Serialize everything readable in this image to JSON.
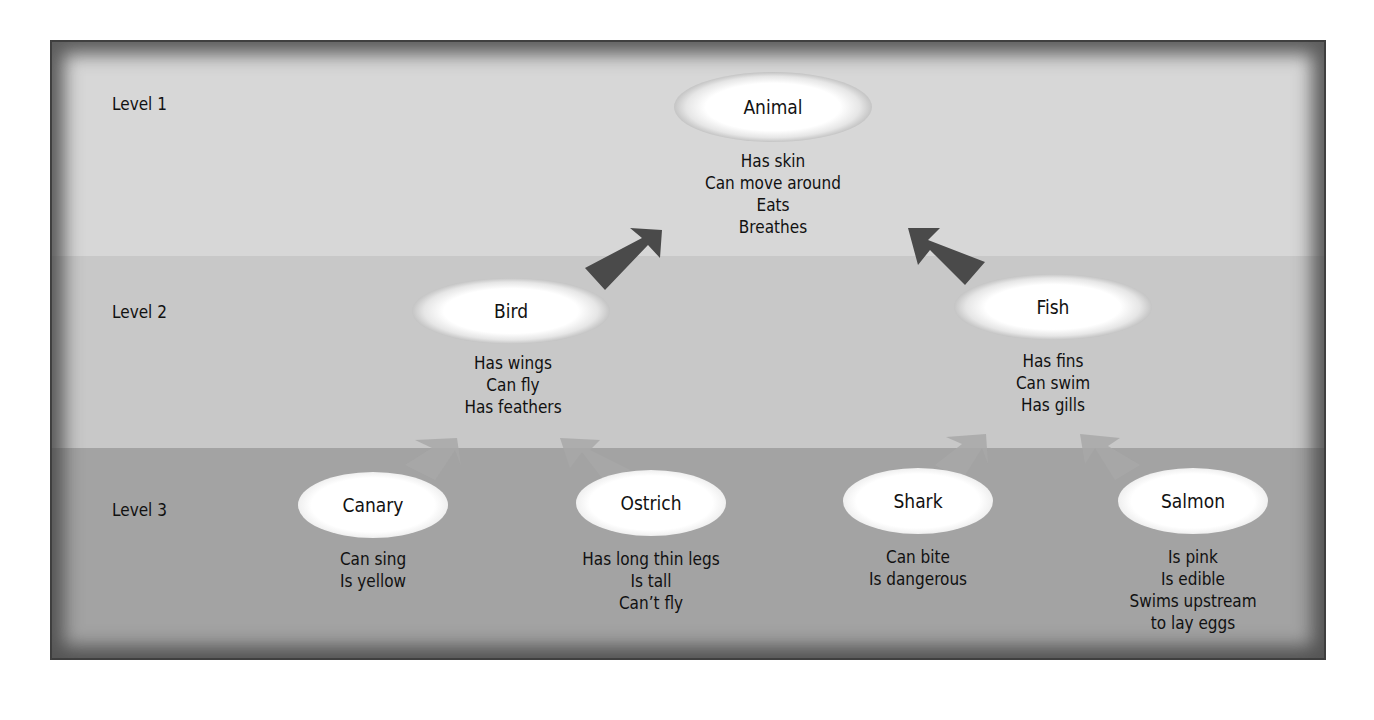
{
  "levels": [
    {
      "label": "Level 1"
    },
    {
      "label": "Level 2"
    },
    {
      "label": "Level 3"
    }
  ],
  "nodes": {
    "animal": {
      "name": "Animal",
      "properties": [
        "Has skin",
        "Can move around",
        "Eats",
        "Breathes"
      ]
    },
    "bird": {
      "name": "Bird",
      "properties": [
        "Has wings",
        "Can fly",
        "Has feathers"
      ]
    },
    "fish": {
      "name": "Fish",
      "properties": [
        "Has fins",
        "Can swim",
        "Has gills"
      ]
    },
    "canary": {
      "name": "Canary",
      "properties": [
        "Can sing",
        "Is yellow"
      ]
    },
    "ostrich": {
      "name": "Ostrich",
      "properties": [
        "Has long thin legs",
        "Is tall",
        "Can’t fly"
      ]
    },
    "shark": {
      "name": "Shark",
      "properties": [
        "Can bite",
        "Is dangerous"
      ]
    },
    "salmon": {
      "name": "Salmon",
      "properties": [
        "Is pink",
        "Is edible",
        "Swims upstream",
        "to lay eggs"
      ]
    }
  },
  "edges": [
    {
      "from": "Bird",
      "to": "Animal"
    },
    {
      "from": "Fish",
      "to": "Animal"
    },
    {
      "from": "Canary",
      "to": "Bird"
    },
    {
      "from": "Ostrich",
      "to": "Bird"
    },
    {
      "from": "Shark",
      "to": "Fish"
    },
    {
      "from": "Salmon",
      "to": "Fish"
    }
  ],
  "colors": {
    "level1_band": "#d7d7d7",
    "level2_band": "#c8c8c8",
    "level3_band": "#a3a3a3",
    "strong_arrow": "#4a4a4a",
    "faint_arrow": "#9a9a9a",
    "frame": "#555555"
  }
}
